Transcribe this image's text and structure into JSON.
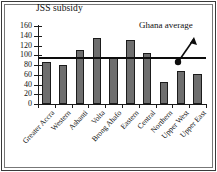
{
  "chart_data": {
    "type": "bar",
    "title": "JSS subsidy",
    "xlabel": "",
    "ylabel": "",
    "ylim": [
      0,
      160
    ],
    "yticks": [
      0,
      20,
      40,
      60,
      80,
      100,
      120,
      140,
      160
    ],
    "grid": false,
    "legend": false,
    "categories": [
      "Greater Accra",
      "Western",
      "Ashanti",
      "Volta",
      "Brong Ahafo",
      "Eastern",
      "Central",
      "Northern",
      "Upper West",
      "Upper East"
    ],
    "values": [
      86,
      79,
      111,
      136,
      97,
      132,
      104,
      46,
      67,
      62
    ],
    "annotations": [
      {
        "text": "Ghana average",
        "type": "reference-line-label",
        "value": 96
      }
    ],
    "reference_line": {
      "label": "Ghana average",
      "value": 96
    }
  },
  "axis": {
    "tick_labels": [
      "160",
      "140",
      "120",
      "100",
      "80",
      "60",
      "40",
      "20",
      "0"
    ]
  },
  "colors": {
    "bar_fill": "#6e6e6e",
    "bar_stroke": "#1b1b1b",
    "axis": "#1a1a1a",
    "text": "#111111",
    "frame_outer": "#3a3a3a",
    "frame_inner": "#777777"
  }
}
